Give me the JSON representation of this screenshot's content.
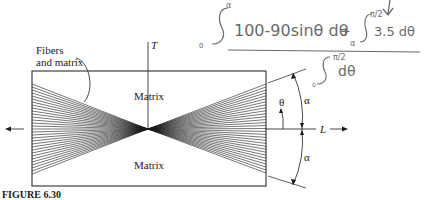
{
  "figure": {
    "caption": "FIGURE 6.30",
    "labels": {
      "fibers_and_matrix_line1": "Fibers",
      "fibers_and_matrix_line2": "and matrix",
      "matrix_top": "Matrix",
      "matrix_bottom": "Matrix",
      "transverse_axis": "T",
      "longitudinal_axis": "L",
      "theta": "θ",
      "alpha_upper": "α",
      "alpha_lower": "α"
    },
    "geometry": {
      "rect": {
        "x": 32,
        "y": 71,
        "width": 234,
        "height": 115
      },
      "center": {
        "x": 148,
        "y": 129
      },
      "fiber_count": 31,
      "fiber_left_range": [
        84,
        174
      ],
      "fiber_right_range": [
        84,
        173
      ]
    },
    "colors": {
      "ink": "#1a1a1a",
      "handwriting": "#6a6a6a"
    }
  },
  "handwriting": {
    "numerator_term1_lower": "0",
    "numerator_term1_upper": "α",
    "numerator_term1_integrand": "100-90sinθ dθ",
    "plus": "+",
    "numerator_term2_lower": "α",
    "numerator_term2_upper": "π/2",
    "numerator_term2_integrand": "3.5 dθ",
    "denominator_lower": "0",
    "denominator_upper": "π/2",
    "denominator_integrand": "dθ"
  }
}
